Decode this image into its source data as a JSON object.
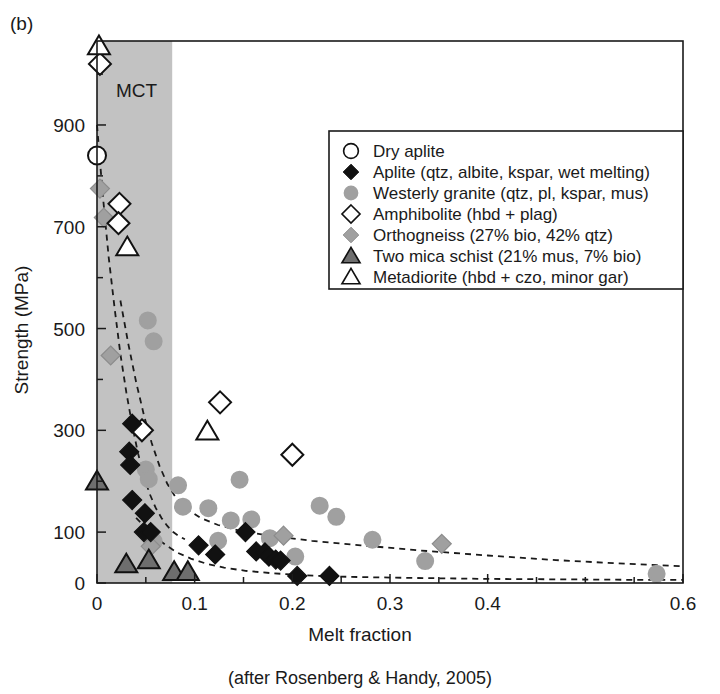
{
  "figure": {
    "panel_label": "(b)",
    "caption": "(after Rosenberg & Handy, 2005)"
  },
  "colors": {
    "band_gray": "#c2c2c2",
    "marker_gray": "#a0a0a0",
    "marker_dark_gray": "#6e6e6e",
    "black": "#111111",
    "white": "#ffffff",
    "axis": "#1a1a1a"
  },
  "band": {
    "label": "MCT",
    "x_start": 0.0,
    "x_end": 0.077
  },
  "chart_data": {
    "type": "scatter",
    "title": "",
    "xlabel": "Melt fraction",
    "ylabel": "Strength (MPa)",
    "xlim": [
      0,
      0.6
    ],
    "ylim": [
      0,
      1065
    ],
    "grid": false,
    "legend_position": "top-right-inset",
    "x_ticks_major": [
      0,
      0.1,
      0.2,
      0.3,
      0.4,
      0.6
    ],
    "x_tick_labels": [
      "0",
      "0.1",
      "0.2",
      "0.3",
      "0.4",
      "0.6"
    ],
    "x_ticks_minor": [
      0.05,
      0.15,
      0.25,
      0.35,
      0.45,
      0.5,
      0.55
    ],
    "y_ticks_major": [
      0,
      100,
      300,
      500,
      700,
      900
    ],
    "y_tick_labels": [
      "0",
      "100",
      "300",
      "500",
      "700",
      "900"
    ],
    "y_ticks_minor": [
      200,
      400,
      600,
      800,
      1000
    ],
    "series": [
      {
        "name": "Dry aplite",
        "marker": "circle-open",
        "fill": "#ffffff",
        "stroke": "#111111",
        "points": [
          [
            0.0,
            840
          ]
        ]
      },
      {
        "name": "Aplite (qtz, albite, kspar, wet melting)",
        "marker": "diamond-filled",
        "fill": "#111111",
        "stroke": "#111111",
        "points": [
          [
            0.036,
            313
          ],
          [
            0.033,
            258
          ],
          [
            0.034,
            232
          ],
          [
            0.036,
            163
          ],
          [
            0.049,
            137
          ],
          [
            0.048,
            100
          ],
          [
            0.055,
            100
          ],
          [
            0.104,
            74
          ],
          [
            0.121,
            56
          ],
          [
            0.152,
            100
          ],
          [
            0.163,
            62
          ],
          [
            0.172,
            60
          ],
          [
            0.176,
            52
          ],
          [
            0.183,
            46
          ],
          [
            0.188,
            44
          ],
          [
            0.205,
            14
          ],
          [
            0.238,
            14
          ]
        ]
      },
      {
        "name": "Westerly granite (qtz, pl, kspar, mus)",
        "marker": "circle-filled",
        "fill": "#a0a0a0",
        "stroke": "#a0a0a0",
        "points": [
          [
            0.052,
            516
          ],
          [
            0.058,
            475
          ],
          [
            0.05,
            223
          ],
          [
            0.053,
            204
          ],
          [
            0.058,
            82
          ],
          [
            0.083,
            192
          ],
          [
            0.088,
            150
          ],
          [
            0.114,
            147
          ],
          [
            0.124,
            83
          ],
          [
            0.137,
            123
          ],
          [
            0.146,
            203
          ],
          [
            0.158,
            125
          ],
          [
            0.177,
            88
          ],
          [
            0.203,
            52
          ],
          [
            0.228,
            152
          ],
          [
            0.245,
            130
          ],
          [
            0.282,
            85
          ],
          [
            0.336,
            43
          ],
          [
            0.573,
            18
          ]
        ]
      },
      {
        "name": "Amphibolite (hbd + plag)",
        "marker": "diamond-open",
        "fill": "#ffffff",
        "stroke": "#111111",
        "points": [
          [
            0.003,
            1020
          ],
          [
            0.023,
            745
          ],
          [
            0.022,
            707
          ],
          [
            0.046,
            300
          ],
          [
            0.126,
            355
          ],
          [
            0.2,
            252
          ]
        ]
      },
      {
        "name": "Orthogneiss (27% bio, 42% qtz)",
        "marker": "diamond-gray",
        "fill": "#a0a0a0",
        "stroke": "#8c8c8c",
        "points": [
          [
            0.003,
            775
          ],
          [
            0.007,
            718
          ],
          [
            0.014,
            447
          ],
          [
            0.055,
            72
          ],
          [
            0.191,
            93
          ],
          [
            0.353,
            77
          ]
        ]
      },
      {
        "name": "Two mica schist (21% mus, 7% bio)",
        "marker": "triangle-gray",
        "fill": "#6e6e6e",
        "stroke": "#111111",
        "points": [
          [
            0.0,
            200
          ],
          [
            0.03,
            37
          ],
          [
            0.053,
            45
          ],
          [
            0.079,
            22
          ],
          [
            0.093,
            22
          ]
        ]
      },
      {
        "name": "Metadiorite (hbd + czo, minor gar)",
        "marker": "triangle-open",
        "fill": "#ffffff",
        "stroke": "#111111",
        "points": [
          [
            0.002,
            1055
          ],
          [
            0.031,
            660
          ],
          [
            0.113,
            298
          ]
        ]
      }
    ],
    "trend_curves": [
      {
        "name": "upper-dashed-envelope",
        "points": [
          [
            0.0,
            900
          ],
          [
            0.006,
            760
          ],
          [
            0.012,
            640
          ],
          [
            0.018,
            540
          ],
          [
            0.024,
            450
          ],
          [
            0.03,
            375
          ],
          [
            0.036,
            310
          ],
          [
            0.042,
            255
          ],
          [
            0.048,
            210
          ],
          [
            0.054,
            175
          ],
          [
            0.06,
            148
          ],
          [
            0.066,
            128
          ],
          [
            0.072,
            112
          ],
          [
            0.078,
            100
          ],
          [
            0.084,
            92
          ],
          [
            0.09,
            86
          ]
        ]
      },
      {
        "name": "middle-dashed-envelope",
        "points": [
          [
            0.024,
            555
          ],
          [
            0.032,
            470
          ],
          [
            0.04,
            395
          ],
          [
            0.048,
            330
          ],
          [
            0.056,
            275
          ],
          [
            0.064,
            230
          ],
          [
            0.072,
            195
          ],
          [
            0.08,
            170
          ],
          [
            0.092,
            145
          ],
          [
            0.106,
            128
          ],
          [
            0.124,
            114
          ],
          [
            0.148,
            102
          ],
          [
            0.18,
            92
          ],
          [
            0.22,
            83
          ],
          [
            0.27,
            74
          ],
          [
            0.33,
            64
          ],
          [
            0.4,
            54
          ],
          [
            0.47,
            45
          ],
          [
            0.54,
            38
          ],
          [
            0.6,
            33
          ]
        ]
      },
      {
        "name": "lower-dashed-envelope",
        "points": [
          [
            0.04,
            128
          ],
          [
            0.05,
            108
          ],
          [
            0.06,
            90
          ],
          [
            0.07,
            75
          ],
          [
            0.082,
            60
          ],
          [
            0.096,
            48
          ],
          [
            0.112,
            38
          ],
          [
            0.13,
            30
          ],
          [
            0.152,
            24
          ],
          [
            0.18,
            19
          ],
          [
            0.215,
            15
          ],
          [
            0.26,
            12
          ],
          [
            0.32,
            10
          ],
          [
            0.4,
            8
          ],
          [
            0.48,
            7
          ],
          [
            0.56,
            6
          ],
          [
            0.6,
            6
          ]
        ]
      }
    ]
  },
  "legend": {
    "items": [
      {
        "label": "Dry aplite",
        "marker": "circle-open"
      },
      {
        "label": "Aplite (qtz, albite, kspar, wet melting)",
        "marker": "diamond-filled"
      },
      {
        "label": "Westerly granite (qtz, pl, kspar, mus)",
        "marker": "circle-filled"
      },
      {
        "label": "Amphibolite (hbd + plag)",
        "marker": "diamond-open"
      },
      {
        "label": "Orthogneiss (27% bio, 42% qtz)",
        "marker": "diamond-gray"
      },
      {
        "label": "Two mica schist (21% mus, 7% bio)",
        "marker": "triangle-gray"
      },
      {
        "label": "Metadiorite (hbd + czo, minor gar)",
        "marker": "triangle-open"
      }
    ]
  }
}
